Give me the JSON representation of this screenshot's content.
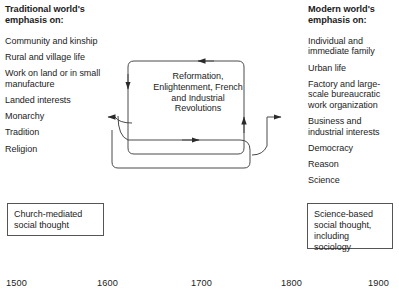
{
  "left_column": {
    "heading": "Traditional world's emphasis on:",
    "items": [
      "Community and kinship",
      "Rural and village life",
      "Work on land or in small manufacture",
      "Landed interests",
      "Monarchy",
      "Tradition",
      "Religion"
    ]
  },
  "right_column": {
    "heading": "Modern world's emphasis on:",
    "items": [
      "Individual and immediate family",
      "Urban life",
      "Factory and large-scale bureaucratic work organization",
      "Business and industrial interests",
      "Democracy",
      "Reason",
      "Science"
    ]
  },
  "center": {
    "label": "Reformation, Enlightenment, French and Industrial Revolutions"
  },
  "outcomes": {
    "left_box": "Church-mediated social thought",
    "right_box": "Science-based social thought, including sociology"
  },
  "timeline": {
    "ticks": [
      "1500",
      "1600",
      "1700",
      "1800",
      "1900"
    ]
  },
  "colors": {
    "background": "#ffffff",
    "text": "#1c1c1c",
    "stroke": "#4a4a4a",
    "box_border": "#555555"
  }
}
